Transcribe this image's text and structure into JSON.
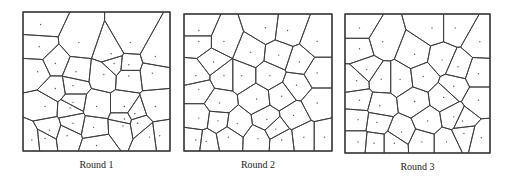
{
  "figure": {
    "stroke_color": "#3a3a3a",
    "point_color": "#555555",
    "panels": [
      {
        "caption": "Round 1",
        "frame": {
          "x": 23,
          "y": 12,
          "w": 147,
          "h": 139
        },
        "seeds": [
          [
            0.12,
            0.09
          ],
          [
            0.11,
            0.25
          ],
          [
            0.38,
            0.22
          ],
          [
            0.6,
            0.3
          ],
          [
            0.73,
            0.22
          ],
          [
            0.9,
            0.32
          ],
          [
            0.1,
            0.43
          ],
          [
            0.22,
            0.37
          ],
          [
            0.36,
            0.43
          ],
          [
            0.55,
            0.45
          ],
          [
            0.62,
            0.37
          ],
          [
            0.72,
            0.38
          ],
          [
            0.72,
            0.46
          ],
          [
            0.88,
            0.44
          ],
          [
            0.22,
            0.55
          ],
          [
            0.34,
            0.53
          ],
          [
            0.15,
            0.68
          ],
          [
            0.32,
            0.69
          ],
          [
            0.5,
            0.68
          ],
          [
            0.69,
            0.68
          ],
          [
            0.76,
            0.73
          ],
          [
            0.9,
            0.68
          ],
          [
            0.18,
            0.85
          ],
          [
            0.34,
            0.8
          ],
          [
            0.48,
            0.83
          ],
          [
            0.68,
            0.82
          ],
          [
            0.78,
            0.8
          ],
          [
            0.06,
            0.92
          ],
          [
            0.15,
            0.91
          ],
          [
            0.3,
            0.89
          ],
          [
            0.5,
            0.96
          ],
          [
            0.86,
            0.9
          ],
          [
            0.93,
            0.89
          ],
          [
            0.69,
            0.77
          ],
          [
            0.34,
            0.65
          ]
        ]
      },
      {
        "caption": "Round 2",
        "frame": {
          "x": 184,
          "y": 14,
          "w": 148,
          "h": 137
        },
        "seeds": [
          [
            0.1,
            0.12
          ],
          [
            0.27,
            0.2
          ],
          [
            0.55,
            0.1
          ],
          [
            0.7,
            0.12
          ],
          [
            0.9,
            0.2
          ],
          [
            0.1,
            0.2
          ],
          [
            0.45,
            0.28
          ],
          [
            0.64,
            0.3
          ],
          [
            0.78,
            0.35
          ],
          [
            0.2,
            0.35
          ],
          [
            0.08,
            0.45
          ],
          [
            0.27,
            0.45
          ],
          [
            0.39,
            0.45
          ],
          [
            0.58,
            0.45
          ],
          [
            0.9,
            0.43
          ],
          [
            0.1,
            0.55
          ],
          [
            0.76,
            0.52
          ],
          [
            0.24,
            0.65
          ],
          [
            0.49,
            0.62
          ],
          [
            0.66,
            0.6
          ],
          [
            0.9,
            0.65
          ],
          [
            0.1,
            0.76
          ],
          [
            0.23,
            0.78
          ],
          [
            0.36,
            0.8
          ],
          [
            0.56,
            0.77
          ],
          [
            0.74,
            0.74
          ],
          [
            0.08,
            0.92
          ],
          [
            0.15,
            0.93
          ],
          [
            0.3,
            0.9
          ],
          [
            0.5,
            0.91
          ],
          [
            0.66,
            0.92
          ],
          [
            0.81,
            0.9
          ],
          [
            0.95,
            0.9
          ],
          [
            0.62,
            0.84
          ]
        ]
      },
      {
        "caption": "Round 3",
        "frame": {
          "x": 345,
          "y": 14,
          "w": 145,
          "h": 139
        },
        "seeds": [
          [
            0.1,
            0.1
          ],
          [
            0.26,
            0.2
          ],
          [
            0.6,
            0.1
          ],
          [
            0.76,
            0.1
          ],
          [
            0.93,
            0.2
          ],
          [
            0.1,
            0.25
          ],
          [
            0.48,
            0.29
          ],
          [
            0.67,
            0.33
          ],
          [
            0.78,
            0.38
          ],
          [
            0.15,
            0.4
          ],
          [
            0.08,
            0.48
          ],
          [
            0.25,
            0.47
          ],
          [
            0.38,
            0.47
          ],
          [
            0.54,
            0.45
          ],
          [
            0.92,
            0.43
          ],
          [
            0.1,
            0.62
          ],
          [
            0.75,
            0.52
          ],
          [
            0.24,
            0.66
          ],
          [
            0.48,
            0.63
          ],
          [
            0.68,
            0.6
          ],
          [
            0.92,
            0.62
          ],
          [
            0.09,
            0.76
          ],
          [
            0.22,
            0.78
          ],
          [
            0.39,
            0.85
          ],
          [
            0.57,
            0.77
          ],
          [
            0.75,
            0.74
          ],
          [
            0.09,
            0.92
          ],
          [
            0.2,
            0.93
          ],
          [
            0.34,
            0.93
          ],
          [
            0.53,
            0.92
          ],
          [
            0.7,
            0.92
          ],
          [
            0.82,
            0.86
          ],
          [
            0.94,
            0.89
          ],
          [
            0.81,
            0.77
          ]
        ]
      }
    ]
  }
}
